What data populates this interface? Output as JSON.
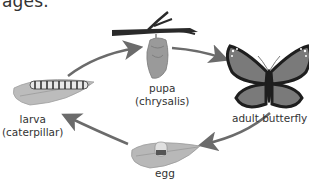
{
  "header": {
    "cut_off_text": "ages."
  },
  "diagram": {
    "stages": [
      {
        "id": "egg",
        "label": "egg",
        "icon": "egg-on-leaf-icon"
      },
      {
        "id": "larva",
        "label_line1": "larva",
        "label_line2": "(caterpillar)",
        "icon": "caterpillar-on-leaf-icon"
      },
      {
        "id": "pupa",
        "label_line1": "pupa",
        "label_line2": "(chrysalis)",
        "icon": "chrysalis-on-branch-icon"
      },
      {
        "id": "adult",
        "label": "adult butterfly",
        "icon": "butterfly-icon"
      }
    ],
    "arrows": [
      {
        "from": "larva",
        "to": "pupa"
      },
      {
        "from": "pupa",
        "to": "adult"
      },
      {
        "from": "adult",
        "to": "egg"
      },
      {
        "from": "egg",
        "to": "larva"
      }
    ],
    "colors": {
      "arrow": "#6b6b6b",
      "leaf": "#b8b8b8",
      "branch": "#2a2a2a",
      "wing": "#7a7a7a",
      "wing_border": "#1e1e1e"
    }
  }
}
